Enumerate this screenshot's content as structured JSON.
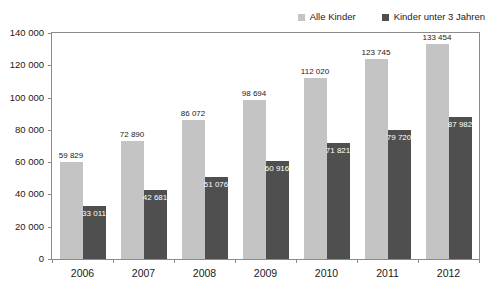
{
  "chart_data": {
    "type": "bar",
    "title": "",
    "xlabel": "",
    "ylabel": "",
    "ylim": [
      0,
      140000
    ],
    "ytick_step": 20000,
    "ytick_labels": [
      "0",
      "20 000",
      "40 000",
      "60 000",
      "80 000",
      "100 000",
      "120 000",
      "140 000"
    ],
    "ytick_values": [
      0,
      20000,
      40000,
      60000,
      80000,
      100000,
      120000,
      140000
    ],
    "grid": false,
    "legend_position": "top-right",
    "categories": [
      "2006",
      "2007",
      "2008",
      "2009",
      "2010",
      "2011",
      "2012"
    ],
    "series": [
      {
        "name": "Alle Kinder",
        "color": "#c4c4c4",
        "label_position": "outside",
        "values": [
          59829,
          72890,
          86072,
          98694,
          112020,
          123745,
          133454
        ],
        "value_labels": [
          "59 829",
          "72 890",
          "86 072",
          "98 694",
          "112 020",
          "123 745",
          "133 454"
        ]
      },
      {
        "name": "Kinder unter 3 Jahren",
        "color": "#4f4f4f",
        "label_position": "inside",
        "values": [
          33011,
          42681,
          51076,
          60916,
          71821,
          79720,
          87982
        ],
        "value_labels": [
          "33 011",
          "42 681",
          "51 076",
          "60 916",
          "71 821",
          "79 720",
          "87 982"
        ]
      }
    ]
  },
  "legend": {
    "items": [
      {
        "label": "Alle Kinder",
        "color": "#c4c4c4"
      },
      {
        "label": "Kinder unter 3 Jahren",
        "color": "#4f4f4f"
      }
    ]
  }
}
